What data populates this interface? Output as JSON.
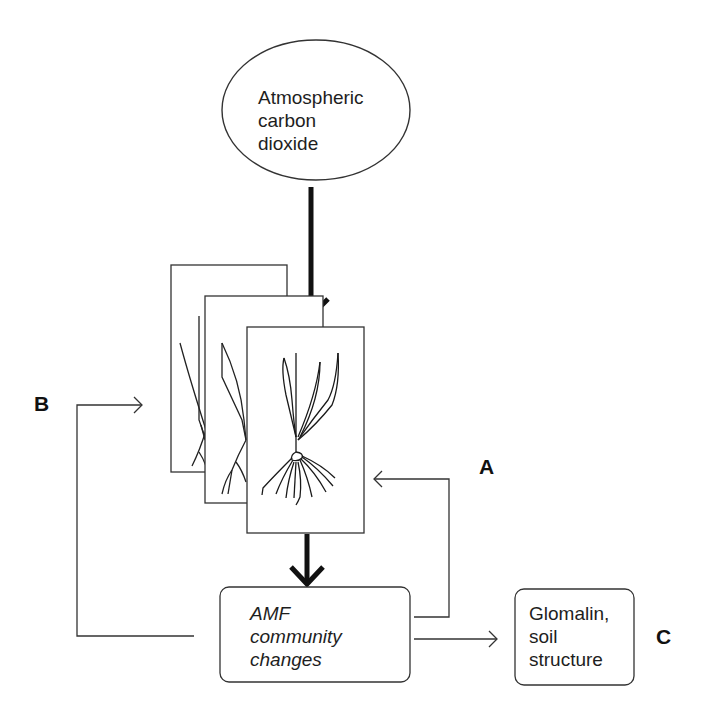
{
  "diagram": {
    "nodes": {
      "co2": {
        "lines": [
          "Atmospheric",
          "carbon",
          "dioxide"
        ],
        "shape": "ellipse"
      },
      "plants": {
        "shape": "stacked-panels",
        "panel_count": 3,
        "content": "plant-with-roots"
      },
      "amf": {
        "lines": [
          "AMF",
          "community",
          "changes"
        ],
        "shape": "rounded-rect",
        "style": "italic"
      },
      "glomalin": {
        "lines": [
          "Glomalin,",
          "soil",
          "structure"
        ],
        "shape": "rounded-rect"
      }
    },
    "labels": {
      "a": "A",
      "b": "B",
      "c": "C"
    },
    "edges": [
      {
        "from": "co2",
        "to": "plants",
        "style": "thick"
      },
      {
        "from": "plants",
        "to": "amf",
        "style": "thick"
      },
      {
        "from": "amf",
        "to": "plants",
        "style": "thin",
        "label": "A"
      },
      {
        "from": "amf",
        "to": "plants",
        "style": "thin",
        "label": "B"
      },
      {
        "from": "amf",
        "to": "glomalin",
        "style": "thin",
        "label": "C"
      }
    ],
    "colors": {
      "stroke": "#1a1a1a",
      "background": "#ffffff"
    }
  }
}
